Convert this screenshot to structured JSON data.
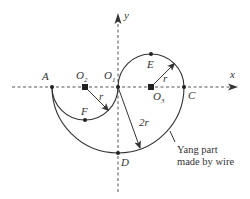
{
  "diagram": {
    "axes": {
      "x_label": "x",
      "y_label": "y"
    },
    "points": {
      "A": "A",
      "O1": {
        "base": "O",
        "sub": "1"
      },
      "O2": {
        "base": "O",
        "sub": "2"
      },
      "O3": {
        "base": "O",
        "sub": "3"
      },
      "C": "C",
      "D": "D",
      "E": "E",
      "F": "F"
    },
    "radius_labels": {
      "small": "r",
      "big": "2r"
    },
    "annotation": {
      "line1": "Yang part",
      "line2": "made by wire"
    },
    "colors": {
      "stroke": "#333333",
      "background": "#ffffff"
    }
  }
}
